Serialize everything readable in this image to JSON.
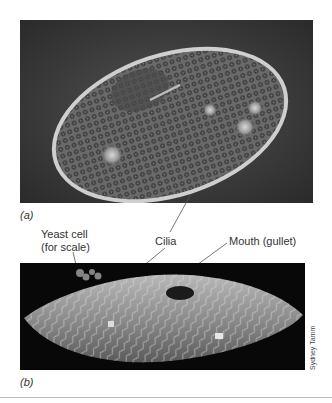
{
  "figure": {
    "panel_a": {
      "label": "(a)",
      "description": "Phase-contrast light micrograph of a ciliate (Paramecium) cell"
    },
    "panel_b": {
      "label": "(b)",
      "description": "Scanning electron micrograph of a ciliate showing rows of cilia"
    },
    "callouts": [
      {
        "text_line1": "Yeast cell",
        "text_line2": "(for scale)"
      },
      {
        "text_line1": "Cilia"
      },
      {
        "text_line1": "Mouth (gullet)"
      }
    ],
    "credit": "Sydney Tamm"
  }
}
